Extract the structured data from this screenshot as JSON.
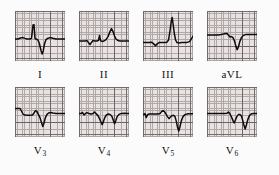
{
  "figure": {
    "kind": "ecg-strip-montage",
    "rows": 2,
    "columns": 4,
    "background_color": "#fbfbfb",
    "grid_color": "#a89f9f",
    "grid_major_color": "#5d5555",
    "paper_color": "#e8e2e2",
    "trace_color": "#100c0c",
    "label_color": "#15110f"
  },
  "rows": [
    {
      "name": "limb-leads",
      "panels": [
        {
          "label": "I",
          "label_base": "I",
          "label_sub": "",
          "trace": "M0,28 L3,28 L5.5,27 L8,26.6 L10,27.4 L12,28 L15,28 L16.5,27.4 L18,14 L19,13.6 L20,27.6 L21.5,28.2 L23,29 L24.5,33 L26,39.5 L27.2,43 L28.2,40 L29.5,33 L31,28.6 L33,27.2 L35,26.6 L37,27 L39,27.6 L41,28 L44,28 L47,28 L50,28"
        },
        {
          "label": "II",
          "label_base": "II",
          "label_sub": "",
          "trace": "M0,30 L3,30 L6,30 L8,29.6 L9.5,31.6 L11,33.6 L12.5,31.4 L14,29.6 L16,30 L18,30 L19.5,29.4 L20.5,24.5 L21.5,29.6 L23,30.4 L25,30 L27,28.6 L29,25.6 L31,20.6 L32.5,17.6 L34,20.6 L35.5,25 L37,28 L39,29.6 L41,30 L44,30 L47,30 L50,30"
        },
        {
          "label": "III",
          "label_base": "III",
          "label_sub": "",
          "trace": "M0,31.5 L3,31.5 L6,31.5 L8.5,31.2 L10.5,32.6 L12.5,34.6 L14.5,32.6 L16.5,31.4 L19,31.5 L22,31.5 L24,31.2 L25.5,29 L27,20 L28.2,10.5 L29.2,6.5 L30.2,14 L31.4,23 L32.6,29 L34,31.6 L36,32 L38.5,31.6 L41,31.4 L44,31.4 L46.5,30.6 L48,28.5 L50,25"
        },
        {
          "label": "aVL",
          "label_base": "aVL",
          "label_sub": "",
          "trace": "M0,24 L4,24 L8,24 L11,24 L14,23.6 L16.5,23 L18.5,22.4 L20,22.6 L21.5,24.2 L23,26 L24.5,25.6 L26,26.6 L27.5,30 L29,35.6 L30.2,38.6 L31.4,36 L32.8,30.6 L34.4,26.6 L36,24.6 L38.5,23.6 L41,23.4 L44,23.4 L47,23.4 L50,23.4"
        }
      ]
    },
    {
      "name": "precordial-leads",
      "panels": [
        {
          "label": "V3",
          "label_base": "V",
          "label_sub": "3",
          "trace": "M0,21.6 L3,21.6 L5,21.4 L6.5,24 L8,27 L9.5,28 L12,28.2 L15,28.2 L17.5,28 L19,26 L20.5,23.6 L22,24.6 L23.5,27.6 L25,30.6 L26.5,35.6 L27.8,39.6 L29,36 L30.4,30.6 L32,27.4 L33.6,26 L35.5,25.6 L38,26 L41,26.4 L44,26.6 L47,26.6 L50,26.6"
        },
        {
          "label": "V4",
          "label_base": "V",
          "label_sub": "4",
          "trace": "M0,26.6 L2,26.6 L3.5,25.4 L5,28 L6.5,26.4 L8,25.6 L10,26.6 L12,27 L14,26.6 L15.5,25 L17,26.6 L19,28.6 L20.5,31.6 L22,35 L23.2,37.6 L24.4,34.6 L25.8,30.6 L27.4,28 L29.4,27 L31.4,27.6 L33,29.6 L34.4,33.6 L35.6,36.6 L36.8,33.6 L38.2,29.6 L40,27.4 L42.5,26.4 L45.5,26.2 L48,26.6 L50,26.6"
        },
        {
          "label": "V5",
          "label_base": "V",
          "label_sub": "5",
          "trace": "M0,28 L2,26.6 L3.2,30.6 L4.5,27.6 L6,27 L9,27 L12,27 L15,27 L17,26.6 L18.5,24.6 L20,23.6 L21.5,24.6 L23,27 L24.5,29.6 L26,31.6 L27.5,30 L29,28.6 L30.5,28.2 L32,29.6 L33.4,34.6 L34.6,40.6 L35.8,44 L37,39.6 L38.4,33.6 L40,29.6 L42,27.6 L45,26.8 L48,26.8 L50,26.8"
        },
        {
          "label": "V6",
          "label_base": "V",
          "label_sub": "6",
          "trace": "M0,26.6 L3,26.6 L6,26.6 L9,26.6 L12,26.6 L15,26.6 L18,26.6 L20,26.2 L21.5,25 L23,27 L24.5,30 L26,33.6 L27.2,36 L28.4,33 L29.8,29.6 L31.4,27.6 L33,27.4 L34.4,29 L35.8,33.6 L37,38.6 L38.2,42 L39.4,38 L40.8,32.6 L42.4,28.6 L44.5,26.8 L47,26.4 L50,26.4"
        }
      ]
    }
  ]
}
